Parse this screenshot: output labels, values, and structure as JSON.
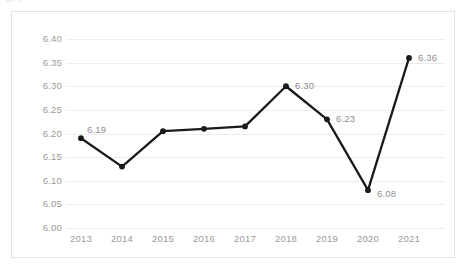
{
  "title_fragment": "图 2  ,  , ,",
  "colors": {
    "series_line": "#1a1a1a",
    "marker": "#1a1a1a",
    "gridline": "#ededed",
    "axis_text": "#9a9a9a",
    "label_text": "#8d8d8d",
    "frame_border": "#e2e2e2",
    "background": "#ffffff"
  },
  "chart_data": {
    "type": "line",
    "title": "",
    "xlabel": "",
    "ylabel": "",
    "categories": [
      "2013",
      "2014",
      "2015",
      "2016",
      "2017",
      "2018",
      "2019",
      "2020",
      "2021"
    ],
    "values": [
      6.19,
      6.13,
      6.205,
      6.21,
      6.215,
      6.3,
      6.23,
      6.08,
      6.36
    ],
    "point_labels": [
      "6.19",
      "",
      "",
      "",
      "",
      "6.30",
      "6.23",
      "6.08",
      "6.36"
    ],
    "ylim": [
      6.0,
      6.4
    ],
    "yticks": [
      "6.00",
      "6.05",
      "6.10",
      "6.15",
      "6.20",
      "6.25",
      "6.30",
      "6.35",
      "6.40"
    ],
    "ytick_values": [
      6.0,
      6.05,
      6.1,
      6.15,
      6.2,
      6.25,
      6.3,
      6.35,
      6.4
    ],
    "grid": true,
    "legend": "none",
    "markers": true
  }
}
